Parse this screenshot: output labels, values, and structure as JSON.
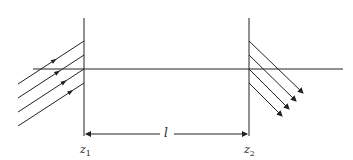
{
  "diagram": {
    "colors": {
      "line": "#222222",
      "background": "#ffffff"
    },
    "planes": [
      {
        "id": "z1",
        "label": "z",
        "sub": "1",
        "x": 84
      },
      {
        "id": "z2",
        "label": "z",
        "sub": "2",
        "x": 249
      }
    ],
    "axis": {
      "y": 69,
      "x_start": 33,
      "x_end": 343
    },
    "separation": {
      "label": "l",
      "y": 134
    },
    "incident_rays": [
      {
        "x1": 18,
        "y1": 84,
        "x2": 84,
        "y2": 41,
        "arrow_at": 0.55
      },
      {
        "x1": 18,
        "y1": 98,
        "x2": 84,
        "y2": 55,
        "arrow_at": 0.6
      },
      {
        "x1": 18,
        "y1": 112,
        "x2": 84,
        "y2": 69,
        "arrow_at": 0.7
      },
      {
        "x1": 18,
        "y1": 126,
        "x2": 84,
        "y2": 83,
        "arrow_at": 0.8
      }
    ],
    "transmitted_rays": [
      {
        "x1": 249,
        "y1": 41,
        "x2": 303,
        "y2": 93
      },
      {
        "x1": 249,
        "y1": 55,
        "x2": 296,
        "y2": 101
      },
      {
        "x1": 249,
        "y1": 69,
        "x2": 289,
        "y2": 109
      },
      {
        "x1": 249,
        "y1": 83,
        "x2": 282,
        "y2": 116
      }
    ]
  }
}
